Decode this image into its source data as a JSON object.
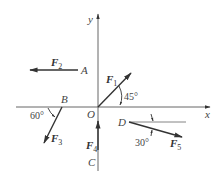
{
  "diagram": {
    "axes": {
      "x_label": "x",
      "y_label": "y",
      "origin_label": "O"
    },
    "points": {
      "A": "A",
      "B": "B",
      "C": "C",
      "D": "D"
    },
    "forces": [
      {
        "name": "F",
        "sub": "1",
        "point": "O",
        "angle_label": "45°",
        "direction": "up-right"
      },
      {
        "name": "F",
        "sub": "2",
        "point": "A",
        "direction": "left"
      },
      {
        "name": "F",
        "sub": "3",
        "point": "B",
        "angle_label": "60°",
        "direction": "down-left"
      },
      {
        "name": "F",
        "sub": "4",
        "point": "C",
        "direction": "up"
      },
      {
        "name": "F",
        "sub": "5",
        "point": "D",
        "angle_label": "30°",
        "direction": "down-right"
      }
    ],
    "colors": {
      "line": "#555555",
      "arrow": "#333333",
      "text": "#444444"
    }
  }
}
